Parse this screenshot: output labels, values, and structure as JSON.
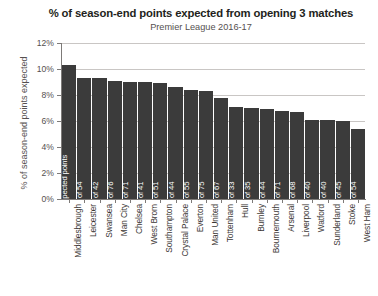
{
  "chart_data": {
    "type": "bar",
    "title": "% of season-end points expected from opening 3 matches",
    "subtitle": "Premier League 2016-17",
    "xlabel": "",
    "ylabel": "% of season-end points expected",
    "ylim": [
      0,
      12
    ],
    "yticks": [
      "0%",
      "2%",
      "4%",
      "6%",
      "8%",
      "10%",
      "12%"
    ],
    "ytick_values": [
      0,
      2,
      4,
      6,
      8,
      10,
      12
    ],
    "grid": true,
    "legend": false,
    "categories": [
      "Middlesbrough",
      "Leicester",
      "Swansea",
      "Man City",
      "Chelsea",
      "West Brom",
      "Southampton",
      "Crystal Palace",
      "Everton",
      "Man United",
      "Tottenham",
      "Hull",
      "Burnley",
      "Bournemouth",
      "Arsenal",
      "Liverpool",
      "Watford",
      "Sunderland",
      "Stoke",
      "West Ham"
    ],
    "values": [
      10.3,
      9.3,
      9.3,
      9.1,
      9.0,
      9.0,
      8.9,
      8.6,
      8.4,
      8.3,
      7.8,
      7.1,
      7.0,
      6.9,
      6.8,
      6.7,
      6.1,
      6.1,
      6.0,
      5.4
    ],
    "bar_labels": [
      "4.1 of 40 expected points",
      "5.0 of 54",
      "3.9 of 42",
      "6.9 of 76",
      "6.5 of 71",
      "3.7 of 41",
      "4.6 of 51",
      "3.8 of 44",
      "4.6 of 55",
      "6.2 of 75",
      "5.2 of 67",
      "2.3 of 33",
      "2.5 of 35",
      "3.0 of 44",
      "4.9 of 71",
      "4.6 of 68",
      "2.4 of 40",
      "2.5 of 40",
      "2.7 of 45",
      "2.9 of 54"
    ],
    "colors": {
      "bar": "#3b3b3b",
      "grid": "#c9c6c4",
      "axis": "#7d7a78",
      "title_text": "#231f20",
      "label_text": "#55504f",
      "bar_label_text": "#ffffff"
    }
  }
}
